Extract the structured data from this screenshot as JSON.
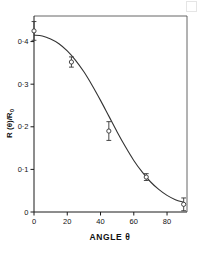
{
  "chart_data": {
    "type": "scatter",
    "title": "",
    "xlabel": "ANGLE θ",
    "ylabel": "R (θ)/R",
    "ylabel_sub": "0",
    "xlim": [
      0,
      92
    ],
    "ylim": [
      0,
      0.46
    ],
    "grid": false,
    "legend": null,
    "x_ticks": [
      0,
      20,
      40,
      60,
      80
    ],
    "x_tick_labels": [
      "0",
      "20",
      "40",
      "60",
      "80"
    ],
    "y_ticks": [
      0,
      0.1,
      0.2,
      0.3,
      0.4
    ],
    "y_tick_labels": [
      "0",
      "0·1",
      "0·2",
      "0·3",
      "0·4"
    ],
    "x": [
      0,
      22.5,
      45,
      67.5,
      90
    ],
    "values": [
      0.425,
      0.352,
      0.19,
      0.082,
      0.018
    ],
    "yerr": [
      0.022,
      0.012,
      0.022,
      0.008,
      0.015
    ],
    "marker": "open-circle",
    "fit_curve": {
      "name": "model fit",
      "x": [
        0,
        5,
        10,
        15,
        20,
        25,
        30,
        35,
        40,
        45,
        50,
        55,
        60,
        65,
        70,
        75,
        80,
        85,
        90
      ],
      "y": [
        0.415,
        0.413,
        0.406,
        0.395,
        0.378,
        0.356,
        0.329,
        0.297,
        0.262,
        0.225,
        0.188,
        0.153,
        0.121,
        0.094,
        0.071,
        0.053,
        0.039,
        0.029,
        0.023
      ]
    }
  },
  "figure": {
    "plot_left_px": 34,
    "plot_right_px": 187,
    "plot_top_px": 16,
    "plot_bottom_px": 212,
    "corner_mark": "page-corner-artifact"
  }
}
